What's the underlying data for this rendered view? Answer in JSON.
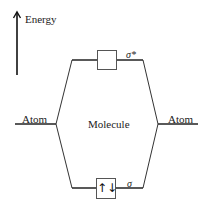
{
  "diagram": {
    "type": "molecular-orbital-diagram",
    "axis": {
      "label": "Energy",
      "icon": "up-arrow-icon"
    },
    "left_label": "Atom",
    "right_label": "Atom",
    "center_label": "Molecule",
    "orbitals": {
      "antibonding": {
        "label": "σ*",
        "electrons": ""
      },
      "bonding": {
        "label": "σ",
        "electrons": "↑↓"
      }
    },
    "colors": {
      "line": "#222222",
      "box_border": "#555555"
    }
  }
}
